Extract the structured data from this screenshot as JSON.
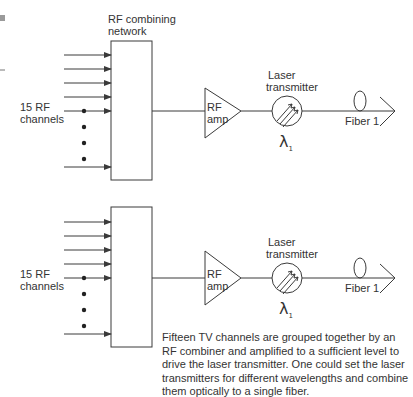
{
  "diagram": {
    "blocks": {
      "combiner_label_line1": "RF combining",
      "combiner_label_line2": "network",
      "input_label_line1": "15 RF",
      "input_label_line2": "channels",
      "amp_label_line1": "RF",
      "amp_label_line2": "amp",
      "laser_label_line1": "Laser",
      "laser_label_line2": "transmitter",
      "wavelength_symbol": "λ",
      "wavelength_subscript": "1",
      "fiber_label": "Fiber 1"
    },
    "rows": [
      {
        "id": "top",
        "combiner": "RF combining network",
        "inputs": "15 RF channels",
        "amp": "RF amp",
        "laser": "Laser transmitter",
        "wavelength": "λ1",
        "fiber": "Fiber 1"
      },
      {
        "id": "bottom",
        "combiner": "",
        "inputs": "15 RF channels",
        "amp": "RF amp",
        "laser": "Laser transmitter",
        "wavelength": "λ1",
        "fiber": "Fiber 1"
      }
    ],
    "caption": "Fifteen TV channels are grouped together by an RF combiner and amplified to a sufficient level to drive the laser transmitter. One could set the laser transmitters for different wavelengths and combine them optically to a single fiber.",
    "colors": {
      "line": "#3a3a3a",
      "text": "#333333",
      "margin_marker": "#9a9a9a"
    }
  }
}
